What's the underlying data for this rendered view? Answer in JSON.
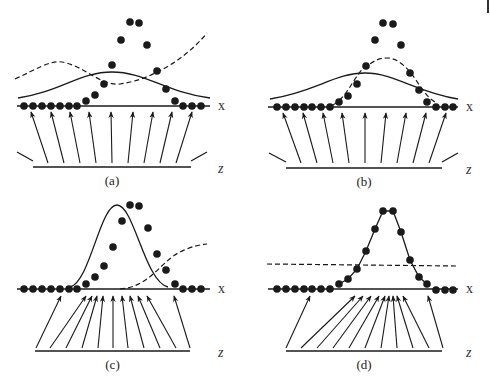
{
  "figure": {
    "axis_labels": {
      "data_space": "x",
      "latent_space": "z"
    },
    "panels": [
      {
        "id": "a",
        "caption": "(a)",
        "offset": [
          0,
          0
        ],
        "x_axis": {
          "y": 106,
          "x1": 17,
          "x2": 210
        },
        "z_axis": {
          "y": 167,
          "x1": 33,
          "x2": 191
        },
        "side_ticks": [
          [
            17,
            152,
            33,
            161
          ],
          [
            191,
            161,
            207,
            152
          ]
        ],
        "points": [
          [
            24,
            106
          ],
          [
            33,
            106
          ],
          [
            42,
            106
          ],
          [
            51,
            106
          ],
          [
            60,
            106
          ],
          [
            69,
            106
          ],
          [
            77,
            106
          ],
          [
            86,
            101
          ],
          [
            95,
            95
          ],
          [
            104,
            84
          ],
          [
            112,
            65
          ],
          [
            121,
            40
          ],
          [
            130,
            22
          ],
          [
            139,
            23
          ],
          [
            147,
            45
          ],
          [
            157,
            71
          ],
          [
            166,
            89
          ],
          [
            175,
            101
          ],
          [
            183,
            106
          ],
          [
            192,
            106
          ],
          [
            201,
            106
          ]
        ],
        "arrows": [
          [
            48,
            163,
            31,
            112
          ],
          [
            64,
            163,
            51,
            112
          ],
          [
            80,
            163,
            70,
            112
          ],
          [
            96,
            163,
            89,
            112
          ],
          [
            112,
            163,
            111,
            112
          ],
          [
            128,
            163,
            133,
            112
          ],
          [
            144,
            163,
            153,
            112
          ],
          [
            160,
            163,
            172,
            112
          ],
          [
            176,
            163,
            192,
            112
          ]
        ],
        "solid_curve": "M18,98 C60,92 80,72 112,72 C145,72 165,92 210,98",
        "dashed_curve": "M15,79 C35,70 50,60 62,62 C85,66 100,86 120,84 C150,80 185,60 207,33"
      },
      {
        "id": "b",
        "caption": "(b)",
        "offset": [
          245,
          0
        ],
        "x_axis": {
          "y": 107,
          "x1": 23,
          "x2": 213
        },
        "z_axis": {
          "y": 168,
          "x1": 41,
          "x2": 197
        },
        "side_ticks": [
          [
            24,
            153,
            41,
            162
          ],
          [
            197,
            162,
            213,
            153
          ]
        ],
        "points": [
          [
            32,
            107
          ],
          [
            41,
            107
          ],
          [
            50,
            107
          ],
          [
            59,
            107
          ],
          [
            67,
            107
          ],
          [
            76,
            107
          ],
          [
            85,
            107
          ],
          [
            94,
            102
          ],
          [
            103,
            96
          ],
          [
            112,
            84
          ],
          [
            121,
            66
          ],
          [
            130,
            40
          ],
          [
            138,
            23
          ],
          [
            148,
            24
          ],
          [
            156,
            45
          ],
          [
            165,
            73
          ],
          [
            174,
            90
          ],
          [
            182,
            102
          ],
          [
            191,
            107
          ],
          [
            200,
            107
          ],
          [
            208,
            107
          ]
        ],
        "arrows": [
          [
            56,
            163,
            38,
            113
          ],
          [
            72,
            163,
            58,
            113
          ],
          [
            88,
            163,
            78,
            113
          ],
          [
            104,
            163,
            97,
            113
          ],
          [
            120,
            163,
            120,
            113
          ],
          [
            136,
            163,
            141,
            113
          ],
          [
            152,
            163,
            161,
            113
          ],
          [
            168,
            163,
            181,
            113
          ],
          [
            184,
            163,
            201,
            113
          ]
        ],
        "solid_curve": "M25,99 C70,92 90,73 120,73 C150,73 170,92 213,99",
        "dashed_curve": "M88,105 C105,95 110,72 122,66 C130,60 135,58 142,58 C152,58 160,66 166,73 C175,85 180,96 190,102"
      },
      {
        "id": "c",
        "caption": "(c)",
        "offset": [
          0,
          190
        ],
        "x_axis": {
          "y": 99,
          "x1": 17,
          "x2": 210
        },
        "z_axis": {
          "y": 161,
          "x1": 35,
          "x2": 190
        },
        "side_ticks": [],
        "points": [
          [
            24,
            99
          ],
          [
            33,
            99
          ],
          [
            42,
            99
          ],
          [
            51,
            99
          ],
          [
            60,
            99
          ],
          [
            69,
            99
          ],
          [
            77,
            99
          ],
          [
            86,
            94
          ],
          [
            95,
            87
          ],
          [
            104,
            76
          ],
          [
            113,
            57
          ],
          [
            122,
            31
          ],
          [
            130,
            15
          ],
          [
            139,
            16
          ],
          [
            148,
            38
          ],
          [
            157,
            64
          ],
          [
            166,
            80
          ],
          [
            175,
            94
          ],
          [
            183,
            99
          ],
          [
            192,
            99
          ],
          [
            201,
            99
          ]
        ],
        "arrows": [
          [
            36,
            158,
            61,
            106
          ],
          [
            50,
            158,
            86,
            106
          ],
          [
            66,
            158,
            92,
            106
          ],
          [
            82,
            158,
            97,
            106
          ],
          [
            98,
            158,
            103,
            106
          ],
          [
            113,
            158,
            113,
            106
          ],
          [
            128,
            158,
            122,
            106
          ],
          [
            144,
            158,
            130,
            106
          ],
          [
            160,
            158,
            138,
            106
          ],
          [
            176,
            158,
            147,
            106
          ],
          [
            190,
            158,
            174,
            106
          ]
        ],
        "solid_curve": "M70,97 C90,92 100,15 117,15 C134,15 145,92 168,97",
        "dashed_curve": "M120,99 C150,97 160,72 180,62 C195,55 200,55 207,54"
      },
      {
        "id": "d",
        "caption": "(d)",
        "offset": [
          245,
          190
        ],
        "x_axis": {
          "y": 99,
          "x1": 23,
          "x2": 213
        },
        "z_axis": {
          "y": 161,
          "x1": 41,
          "x2": 197
        },
        "side_ticks": [],
        "points": [
          [
            32,
            99
          ],
          [
            41,
            99
          ],
          [
            50,
            99
          ],
          [
            59,
            99
          ],
          [
            67,
            99
          ],
          [
            76,
            99
          ],
          [
            85,
            99
          ],
          [
            94,
            94
          ],
          [
            103,
            89
          ],
          [
            112,
            79
          ],
          [
            121,
            61
          ],
          [
            130,
            39
          ],
          [
            138,
            21
          ],
          [
            148,
            21
          ],
          [
            156,
            42
          ],
          [
            165,
            70
          ],
          [
            174,
            87
          ],
          [
            182,
            94
          ],
          [
            191,
            100
          ],
          [
            200,
            100
          ],
          [
            208,
            100
          ]
        ],
        "arrows": [
          [
            41,
            158,
            65,
            106
          ],
          [
            56,
            158,
            110,
            106
          ],
          [
            72,
            158,
            118,
            106
          ],
          [
            88,
            158,
            126,
            106
          ],
          [
            104,
            158,
            134,
            106
          ],
          [
            120,
            158,
            140,
            106
          ],
          [
            136,
            158,
            144,
            106
          ],
          [
            152,
            158,
            148,
            106
          ],
          [
            168,
            158,
            152,
            106
          ],
          [
            184,
            158,
            158,
            106
          ],
          [
            198,
            158,
            183,
            106
          ]
        ],
        "solid_curve": "M94,94 L103,89 L112,79 L121,61 L130,39 L138,21 L148,21 L156,42 L165,70 L174,87 L182,94",
        "dashed_curve": "M22,74 L213,76"
      }
    ],
    "colors": {
      "ink": "#1a1a1a",
      "background": "#ffffff"
    }
  }
}
